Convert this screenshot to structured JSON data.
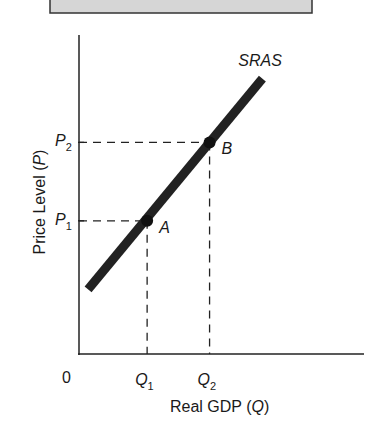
{
  "header_box": {
    "fill": "#d6d6d6",
    "border": "#333333"
  },
  "chart_data": {
    "type": "line",
    "title": "",
    "xlabel": "Real GDP (Q)",
    "xlabel_text": "Real GDP (",
    "xlabel_var": "Q",
    "xlabel_close": ")",
    "ylabel": "Price Level (P)",
    "ylabel_text": "Price Level (",
    "ylabel_var": "P",
    "ylabel_close": ")",
    "origin_label": "0",
    "xlim": [
      0,
      4
    ],
    "ylim": [
      0,
      4
    ],
    "series": [
      {
        "name": "SRAS",
        "label": "SRAS",
        "x": [
          0.16,
          3.23
        ],
        "y": [
          0.93,
          3.97
        ],
        "color": "#222222"
      }
    ],
    "points": [
      {
        "label": "A",
        "x": 1.2,
        "y": 1.92
      },
      {
        "label": "B",
        "x": 2.3,
        "y": 3.05
      }
    ],
    "x_ticks": [
      {
        "var": "Q",
        "sub": "1",
        "value": 1.2
      },
      {
        "var": "Q",
        "sub": "2",
        "value": 2.3
      }
    ],
    "y_ticks": [
      {
        "var": "P",
        "sub": "1",
        "value": 1.92
      },
      {
        "var": "P",
        "sub": "2",
        "value": 3.05
      }
    ],
    "grid": false,
    "guides": "dashed lines from points A and B to both axes"
  }
}
